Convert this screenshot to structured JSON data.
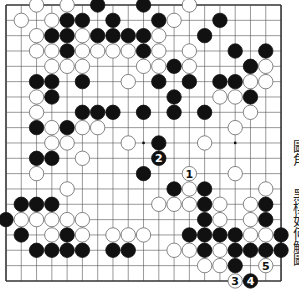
{
  "diagram": {
    "type": "go-board",
    "size": 19,
    "origin": {
      "x": 6,
      "y": 5
    },
    "spacing": {
      "x": 15.28,
      "y": 15.33
    },
    "colors": {
      "line": "#555555",
      "edge": "#333333",
      "black": "#111111",
      "white": "#ffffff",
      "stone_outline": "#666666"
    },
    "star_points": [
      [
        9,
        9
      ],
      [
        15,
        9
      ]
    ],
    "stones": [
      {
        "c": 2,
        "r": 0,
        "color": "W"
      },
      {
        "c": 4,
        "r": 0,
        "color": "W"
      },
      {
        "c": 6,
        "r": 0,
        "color": "B"
      },
      {
        "c": 9,
        "r": 0,
        "color": "B"
      },
      {
        "c": 12,
        "r": 0,
        "color": "W"
      },
      {
        "c": 1,
        "r": 1,
        "color": "W"
      },
      {
        "c": 3,
        "r": 1,
        "color": "W"
      },
      {
        "c": 4,
        "r": 1,
        "color": "B"
      },
      {
        "c": 5,
        "r": 1,
        "color": "B"
      },
      {
        "c": 7,
        "r": 1,
        "color": "B"
      },
      {
        "c": 10,
        "r": 1,
        "color": "B"
      },
      {
        "c": 11,
        "r": 1,
        "color": "W"
      },
      {
        "c": 14,
        "r": 1,
        "color": "B"
      },
      {
        "c": 2,
        "r": 2,
        "color": "W"
      },
      {
        "c": 3,
        "r": 2,
        "color": "B"
      },
      {
        "c": 4,
        "r": 2,
        "color": "B"
      },
      {
        "c": 5,
        "r": 2,
        "color": "W"
      },
      {
        "c": 6,
        "r": 2,
        "color": "B"
      },
      {
        "c": 7,
        "r": 2,
        "color": "B"
      },
      {
        "c": 8,
        "r": 2,
        "color": "B"
      },
      {
        "c": 9,
        "r": 2,
        "color": "B"
      },
      {
        "c": 10,
        "r": 2,
        "color": "W"
      },
      {
        "c": 13,
        "r": 2,
        "color": "B"
      },
      {
        "c": 2,
        "r": 3,
        "color": "W"
      },
      {
        "c": 3,
        "r": 3,
        "color": "W"
      },
      {
        "c": 4,
        "r": 3,
        "color": "B"
      },
      {
        "c": 5,
        "r": 3,
        "color": "W"
      },
      {
        "c": 6,
        "r": 3,
        "color": "W"
      },
      {
        "c": 7,
        "r": 3,
        "color": "W"
      },
      {
        "c": 8,
        "r": 3,
        "color": "W"
      },
      {
        "c": 9,
        "r": 3,
        "color": "B"
      },
      {
        "c": 10,
        "r": 3,
        "color": "W"
      },
      {
        "c": 12,
        "r": 3,
        "color": "W"
      },
      {
        "c": 15,
        "r": 3,
        "color": "B"
      },
      {
        "c": 17,
        "r": 3,
        "color": "B"
      },
      {
        "c": 3,
        "r": 4,
        "color": "W"
      },
      {
        "c": 4,
        "r": 4,
        "color": "W"
      },
      {
        "c": 5,
        "r": 4,
        "color": "W"
      },
      {
        "c": 9,
        "r": 4,
        "color": "W"
      },
      {
        "c": 10,
        "r": 4,
        "color": "W"
      },
      {
        "c": 11,
        "r": 4,
        "color": "B"
      },
      {
        "c": 12,
        "r": 4,
        "color": "W"
      },
      {
        "c": 16,
        "r": 4,
        "color": "B"
      },
      {
        "c": 17,
        "r": 4,
        "color": "W"
      },
      {
        "c": 2,
        "r": 5,
        "color": "B"
      },
      {
        "c": 3,
        "r": 5,
        "color": "B"
      },
      {
        "c": 5,
        "r": 5,
        "color": "B"
      },
      {
        "c": 8,
        "r": 5,
        "color": "W"
      },
      {
        "c": 10,
        "r": 5,
        "color": "B"
      },
      {
        "c": 12,
        "r": 5,
        "color": "B"
      },
      {
        "c": 14,
        "r": 5,
        "color": "B"
      },
      {
        "c": 15,
        "r": 5,
        "color": "B"
      },
      {
        "c": 16,
        "r": 5,
        "color": "W"
      },
      {
        "c": 17,
        "r": 5,
        "color": "W"
      },
      {
        "c": 2,
        "r": 6,
        "color": "W"
      },
      {
        "c": 3,
        "r": 6,
        "color": "B"
      },
      {
        "c": 11,
        "r": 6,
        "color": "B"
      },
      {
        "c": 14,
        "r": 6,
        "color": "W"
      },
      {
        "c": 15,
        "r": 6,
        "color": "W"
      },
      {
        "c": 16,
        "r": 6,
        "color": "B"
      },
      {
        "c": 2,
        "r": 7,
        "color": "W"
      },
      {
        "c": 5,
        "r": 7,
        "color": "B"
      },
      {
        "c": 6,
        "r": 7,
        "color": "B"
      },
      {
        "c": 7,
        "r": 7,
        "color": "B"
      },
      {
        "c": 9,
        "r": 7,
        "color": "B"
      },
      {
        "c": 11,
        "r": 7,
        "color": "B"
      },
      {
        "c": 13,
        "r": 7,
        "color": "B"
      },
      {
        "c": 16,
        "r": 7,
        "color": "W"
      },
      {
        "c": 2,
        "r": 8,
        "color": "B"
      },
      {
        "c": 3,
        "r": 8,
        "color": "W"
      },
      {
        "c": 4,
        "r": 8,
        "color": "B"
      },
      {
        "c": 5,
        "r": 8,
        "color": "W"
      },
      {
        "c": 6,
        "r": 8,
        "color": "W"
      },
      {
        "c": 15,
        "r": 8,
        "color": "W"
      },
      {
        "c": 3,
        "r": 9,
        "color": "W"
      },
      {
        "c": 4,
        "r": 9,
        "color": "W"
      },
      {
        "c": 8,
        "r": 9,
        "color": "W"
      },
      {
        "c": 10,
        "r": 9,
        "color": "B"
      },
      {
        "c": 13,
        "r": 9,
        "color": "W"
      },
      {
        "c": 2,
        "r": 10,
        "color": "B"
      },
      {
        "c": 3,
        "r": 10,
        "color": "B"
      },
      {
        "c": 5,
        "r": 10,
        "color": "W"
      },
      {
        "c": 10,
        "r": 10,
        "color": "B",
        "label": "2"
      },
      {
        "c": 2,
        "r": 11,
        "color": "W"
      },
      {
        "c": 9,
        "r": 11,
        "color": "B"
      },
      {
        "c": 12,
        "r": 11,
        "color": "W",
        "label": "1"
      },
      {
        "c": 15,
        "r": 11,
        "color": "W"
      },
      {
        "c": 4,
        "r": 12,
        "color": "W"
      },
      {
        "c": 11,
        "r": 12,
        "color": "B"
      },
      {
        "c": 12,
        "r": 12,
        "color": "W"
      },
      {
        "c": 13,
        "r": 12,
        "color": "B"
      },
      {
        "c": 17,
        "r": 12,
        "color": "W"
      },
      {
        "c": 1,
        "r": 13,
        "color": "B"
      },
      {
        "c": 2,
        "r": 13,
        "color": "B"
      },
      {
        "c": 3,
        "r": 13,
        "color": "B"
      },
      {
        "c": 10,
        "r": 13,
        "color": "W"
      },
      {
        "c": 11,
        "r": 13,
        "color": "W"
      },
      {
        "c": 12,
        "r": 13,
        "color": "W"
      },
      {
        "c": 13,
        "r": 13,
        "color": "B"
      },
      {
        "c": 14,
        "r": 13,
        "color": "W"
      },
      {
        "c": 16,
        "r": 13,
        "color": "W"
      },
      {
        "c": 17,
        "r": 13,
        "color": "B"
      },
      {
        "c": 0,
        "r": 14,
        "color": "B"
      },
      {
        "c": 1,
        "r": 14,
        "color": "W"
      },
      {
        "c": 2,
        "r": 14,
        "color": "W"
      },
      {
        "c": 3,
        "r": 14,
        "color": "W"
      },
      {
        "c": 4,
        "r": 14,
        "color": "W"
      },
      {
        "c": 5,
        "r": 14,
        "color": "W"
      },
      {
        "c": 13,
        "r": 14,
        "color": "B"
      },
      {
        "c": 14,
        "r": 14,
        "color": "W"
      },
      {
        "c": 16,
        "r": 14,
        "color": "W"
      },
      {
        "c": 17,
        "r": 14,
        "color": "B"
      },
      {
        "c": 1,
        "r": 15,
        "color": "B"
      },
      {
        "c": 3,
        "r": 15,
        "color": "W"
      },
      {
        "c": 4,
        "r": 15,
        "color": "B"
      },
      {
        "c": 5,
        "r": 15,
        "color": "W"
      },
      {
        "c": 7,
        "r": 15,
        "color": "W"
      },
      {
        "c": 8,
        "r": 15,
        "color": "W"
      },
      {
        "c": 9,
        "r": 15,
        "color": "W"
      },
      {
        "c": 12,
        "r": 15,
        "color": "B"
      },
      {
        "c": 13,
        "r": 15,
        "color": "B"
      },
      {
        "c": 14,
        "r": 15,
        "color": "B"
      },
      {
        "c": 15,
        "r": 15,
        "color": "B"
      },
      {
        "c": 16,
        "r": 15,
        "color": "W"
      },
      {
        "c": 17,
        "r": 15,
        "color": "W"
      },
      {
        "c": 18,
        "r": 15,
        "color": "B"
      },
      {
        "c": 2,
        "r": 16,
        "color": "B"
      },
      {
        "c": 3,
        "r": 16,
        "color": "B"
      },
      {
        "c": 4,
        "r": 16,
        "color": "B"
      },
      {
        "c": 5,
        "r": 16,
        "color": "B"
      },
      {
        "c": 7,
        "r": 16,
        "color": "B"
      },
      {
        "c": 8,
        "r": 16,
        "color": "B"
      },
      {
        "c": 11,
        "r": 16,
        "color": "W"
      },
      {
        "c": 12,
        "r": 16,
        "color": "W"
      },
      {
        "c": 13,
        "r": 16,
        "color": "B"
      },
      {
        "c": 14,
        "r": 16,
        "color": "W"
      },
      {
        "c": 15,
        "r": 16,
        "color": "B"
      },
      {
        "c": 16,
        "r": 16,
        "color": "B"
      },
      {
        "c": 17,
        "r": 16,
        "color": "B"
      },
      {
        "c": 18,
        "r": 16,
        "color": "B"
      },
      {
        "c": 13,
        "r": 17,
        "color": "W"
      },
      {
        "c": 14,
        "r": 17,
        "color": "W"
      },
      {
        "c": 15,
        "r": 17,
        "color": "B"
      },
      {
        "c": 17,
        "r": 17,
        "color": "W",
        "label": "5"
      },
      {
        "c": 15,
        "r": 18,
        "color": "W",
        "label": "3"
      },
      {
        "c": 16,
        "r": 18,
        "color": "B",
        "label": "4"
      }
    ]
  },
  "caption": {
    "line1": "圖角",
    "line2": "黑棋如何解圖"
  }
}
